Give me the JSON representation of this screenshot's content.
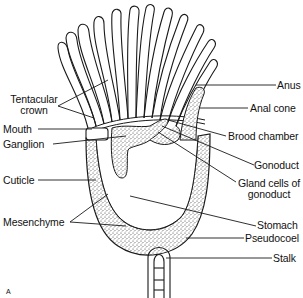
{
  "figure": {
    "panel_letter": "A"
  },
  "labels_left": [
    {
      "id": "tentacular-crown",
      "text_line1": "Tentacular",
      "text_line2": "crown"
    },
    {
      "id": "mouth",
      "text": "Mouth"
    },
    {
      "id": "ganglion",
      "text": "Ganglion"
    },
    {
      "id": "cuticle",
      "text": "Cuticle"
    },
    {
      "id": "mesenchyme",
      "text": "Mesenchyme"
    }
  ],
  "labels_right": [
    {
      "id": "anus",
      "text": "Anus"
    },
    {
      "id": "anal-cone",
      "text": "Anal cone"
    },
    {
      "id": "brood-chamber",
      "text": "Brood chamber"
    },
    {
      "id": "gonoduct",
      "text": "Gonoduct"
    },
    {
      "id": "gland-cells",
      "text_line1": "Gland cells of",
      "text_line2": "gonoduct"
    },
    {
      "id": "stomach",
      "text": "Stomach"
    },
    {
      "id": "pseudocoel",
      "text": "Pseudocoel"
    },
    {
      "id": "stalk",
      "text": "Stalk"
    }
  ],
  "colors": {
    "line": "#1a1a1a",
    "stipple": "#9a9a9a",
    "background": "#ffffff"
  }
}
